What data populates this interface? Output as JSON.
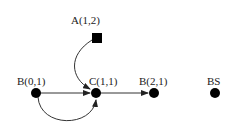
{
  "diagram": {
    "nodes": [
      {
        "id": "A",
        "label": "A(1,2)",
        "shape": "square",
        "x": 97,
        "y": 38
      },
      {
        "id": "B01",
        "label": "B(0,1)",
        "shape": "circle",
        "x": 36,
        "y": 93
      },
      {
        "id": "C",
        "label": "C(1,1)",
        "shape": "circle",
        "x": 96,
        "y": 93
      },
      {
        "id": "B21",
        "label": "B(2,1)",
        "shape": "circle",
        "x": 154,
        "y": 93
      },
      {
        "id": "BS",
        "label": "BS",
        "shape": "circle",
        "x": 215,
        "y": 93
      }
    ],
    "edges": [
      {
        "from": "A",
        "to": "C",
        "style": "curved"
      },
      {
        "from": "B01",
        "to": "C",
        "style": "straight"
      },
      {
        "from": "B01",
        "to": "C",
        "style": "curved-below"
      },
      {
        "from": "C",
        "to": "B21",
        "style": "straight"
      }
    ],
    "colors": {
      "node": "#000000",
      "edge": "#222222",
      "background": "#ffffff"
    }
  }
}
